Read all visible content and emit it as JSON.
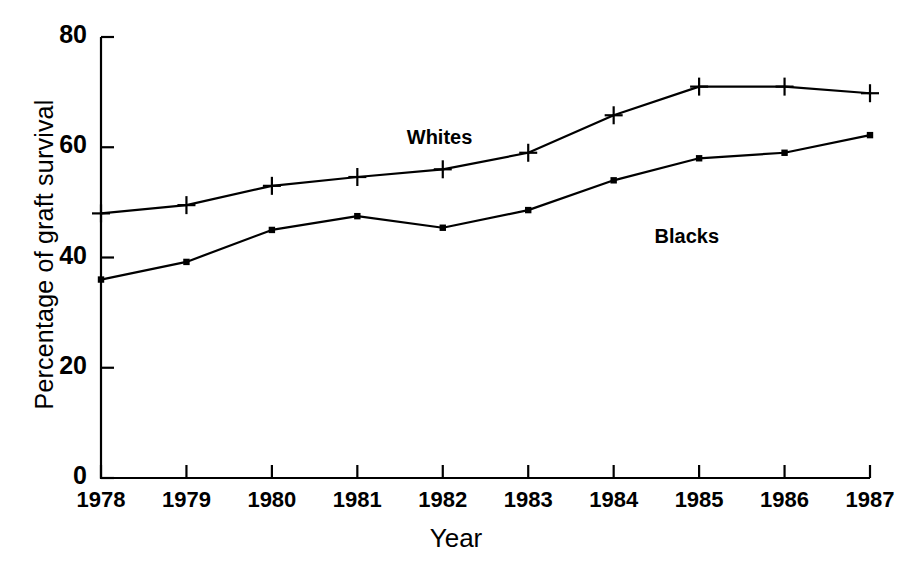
{
  "chart_data": {
    "type": "line",
    "title": "",
    "xlabel": "Year",
    "ylabel": "Percentage of graft survival",
    "categories": [
      "1978",
      "1979",
      "1980",
      "1981",
      "1982",
      "1983",
      "1984",
      "1985",
      "1986",
      "1987"
    ],
    "x": [
      1978,
      1979,
      1980,
      1981,
      1982,
      1983,
      1984,
      1985,
      1986,
      1987
    ],
    "xlim": [
      1978,
      1987
    ],
    "ylim": [
      0,
      80
    ],
    "yticks": [
      0,
      20,
      40,
      60,
      80
    ],
    "ytick_labels": [
      "0",
      "20",
      "40",
      "60",
      "80"
    ],
    "xticks": [
      1978,
      1979,
      1980,
      1981,
      1982,
      1983,
      1984,
      1985,
      1986,
      1987
    ],
    "grid": false,
    "legend_position": "inline-annotation",
    "series": [
      {
        "name": "Whites",
        "marker": "plus",
        "color": "#000000",
        "values": [
          48,
          49.5,
          53,
          54.6,
          56,
          59,
          65.8,
          71,
          71,
          69.8
        ],
        "label_x": 1982.0,
        "label_y": 61.5
      },
      {
        "name": "Blacks",
        "marker": "square",
        "color": "#000000",
        "values": [
          36,
          39.2,
          45,
          47.5,
          45.4,
          48.6,
          54,
          58,
          59,
          62.2
        ],
        "label_x": 1984.9,
        "label_y": 43.5
      }
    ],
    "annotations": [
      {
        "text": "Whites",
        "x": 1982.0,
        "y": 61.5
      },
      {
        "text": "Blacks",
        "x": 1984.9,
        "y": 43.5
      }
    ]
  },
  "axis": {
    "y_title": "Percentage of graft survival",
    "x_title": "Year",
    "y_labels": [
      "80",
      "60",
      "40",
      "20",
      "0"
    ],
    "x_labels": [
      "1978",
      "1979",
      "1980",
      "1981",
      "1982",
      "1983",
      "1984",
      "1985",
      "1986",
      "1987"
    ]
  },
  "colors": {
    "line": "#000000",
    "axis": "#000000",
    "background": "#ffffff"
  }
}
